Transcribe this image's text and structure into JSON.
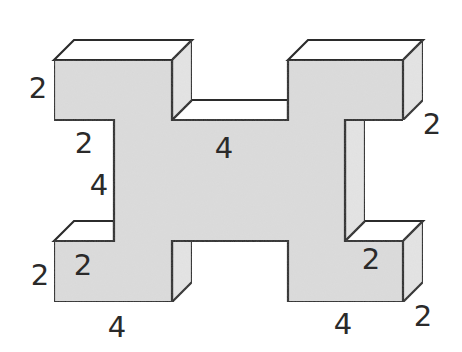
{
  "figure": {
    "colors": {
      "front_fill": "#dcdcdc",
      "side_fill": "#e4e4e4",
      "top_fill": "#ffffff",
      "outline": "#2b2b2b",
      "label": "#2a2a2a"
    },
    "labels": [
      {
        "id": "top-left-block-height",
        "text": "2",
        "x": 38,
        "y": 88
      },
      {
        "id": "top-left-notch-width",
        "text": "2",
        "x": 84,
        "y": 143
      },
      {
        "id": "left-notch-height",
        "text": "4",
        "x": 99,
        "y": 185
      },
      {
        "id": "middle-width",
        "text": "4",
        "x": 224,
        "y": 148
      },
      {
        "id": "top-right-depth",
        "text": "2",
        "x": 432,
        "y": 124
      },
      {
        "id": "bottom-left-block-height",
        "text": "2",
        "x": 40,
        "y": 275
      },
      {
        "id": "bottom-left-inner",
        "text": "2",
        "x": 83,
        "y": 265
      },
      {
        "id": "bottom-left-width",
        "text": "4",
        "x": 117,
        "y": 327
      },
      {
        "id": "bottom-right-inner",
        "text": "2",
        "x": 371,
        "y": 259
      },
      {
        "id": "bottom-right-width",
        "text": "4",
        "x": 343,
        "y": 324
      },
      {
        "id": "bottom-right-depth",
        "text": "2",
        "x": 423,
        "y": 316
      }
    ]
  }
}
